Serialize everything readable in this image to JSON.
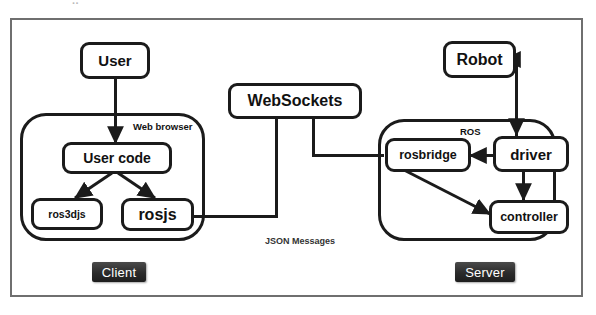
{
  "diagram": {
    "top_artifact_text": "..",
    "nodes": {
      "user": "User",
      "user_code": "User code",
      "ros3djs": "ros3djs",
      "rosjs": "rosjs",
      "websockets": "WebSockets",
      "robot": "Robot",
      "rosbridge": "rosbridge",
      "driver": "driver",
      "controller": "controller"
    },
    "groups": {
      "web_browser": "Web browser",
      "ros": "ROS"
    },
    "pills": {
      "client": "Client",
      "server": "Server"
    },
    "annotations": {
      "json_messages": "JSON Messages"
    },
    "colors": {
      "stroke": "#1b1b1b",
      "frame": "#6f6f6f",
      "pill_bg": "#2b2b2b",
      "pill_text": "#ffffff",
      "background": "#ffffff"
    }
  }
}
